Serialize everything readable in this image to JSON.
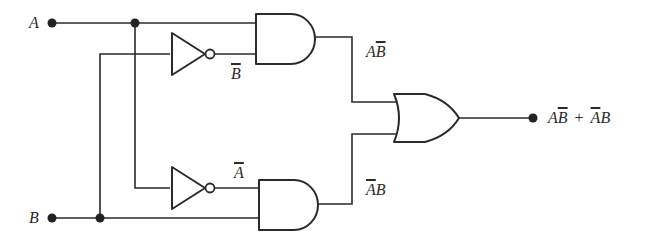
{
  "diagram": {
    "type": "logic-circuit",
    "inputs": {
      "a": "A",
      "b": "B"
    },
    "intermediate_labels": {
      "not_b": {
        "symbol": "B",
        "overbar": true
      },
      "not_a": {
        "symbol": "A",
        "overbar": true
      },
      "and_top": {
        "parts": [
          {
            "t": "A",
            "bar": false
          },
          {
            "t": "B",
            "bar": true
          }
        ]
      },
      "and_bottom": {
        "parts": [
          {
            "t": "A",
            "bar": true
          },
          {
            "t": "B",
            "bar": false
          }
        ]
      }
    },
    "output": {
      "term1": {
        "parts": [
          {
            "t": "A",
            "bar": false
          },
          {
            "t": "B",
            "bar": true
          }
        ]
      },
      "operator": "+",
      "term2": {
        "parts": [
          {
            "t": "A",
            "bar": true
          },
          {
            "t": "B",
            "bar": false
          }
        ]
      }
    },
    "gates": [
      {
        "id": "not-top",
        "type": "NOT",
        "input": "B",
        "output": "B̄"
      },
      {
        "id": "not-bottom",
        "type": "NOT",
        "input": "A",
        "output": "Ā"
      },
      {
        "id": "and-top",
        "type": "AND",
        "inputs": [
          "A",
          "B̄"
        ],
        "output": "AB̄"
      },
      {
        "id": "and-bottom",
        "type": "AND",
        "inputs": [
          "Ā",
          "B"
        ],
        "output": "ĀB"
      },
      {
        "id": "or",
        "type": "OR",
        "inputs": [
          "AB̄",
          "ĀB"
        ],
        "output": "AB̄ + ĀB"
      }
    ],
    "colors": {
      "line": "#2a2a2a",
      "background": "#ffffff"
    }
  }
}
